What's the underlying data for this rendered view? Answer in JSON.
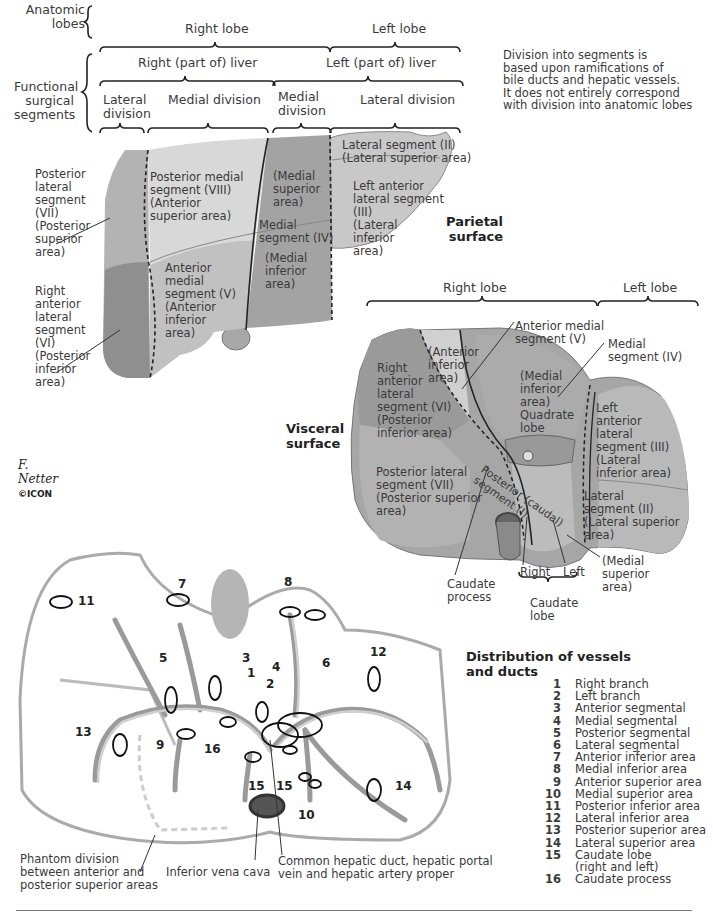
{
  "header": {
    "anatomic_lobes_label": "Anatomic\nlobes",
    "functional_label": "Functional\nsurgical\nsegments",
    "right_lobe": "Right lobe",
    "left_lobe": "Left lobe",
    "right_part": "Right (part of) liver",
    "left_part": "Left (part of) liver",
    "divisions": [
      "Lateral\ndivision",
      "Medial division",
      "Medial\ndivision",
      "Lateral division"
    ],
    "note": "Division into segments is\nbased upon ramifications of\nbile ducts and hepatic vessels.\nIt does not entirely correspond\nwith division into anatomic lobes"
  },
  "parietal": {
    "title": "Parietal\nsurface",
    "labels": {
      "seg_vii": "Posterior\nlateral\nsegment\n(VII)\n(Posterior\nsuperior\narea)",
      "seg_vi": "Right\nanterior\nlateral\nsegment\n(VI)\n(Posterior\ninferior\narea)",
      "seg_viii": "Posterior medial\nsegment (VIII)\n(Anterior\nsuperior area)",
      "seg_v": "Anterior\nmedial\nsegment (V)\n(Anterior\ninferior\narea)",
      "medial_superior": "(Medial\nsuperior\narea)",
      "seg_iv": "Medial\nsegment (IV)",
      "medial_inferior": "(Medial\ninferior\narea)",
      "seg_ii": "Lateral segment (II)\n(Lateral superior area)",
      "seg_iii": "Left anterior\nlateral segment\n(III)\n(Lateral\ninferior\narea)"
    }
  },
  "visceral": {
    "title": "Visceral\nsurface",
    "right_lobe": "Right lobe",
    "left_lobe": "Left lobe",
    "labels": {
      "ant_medial_v": "Anterior medial\nsegment (V)",
      "medial_iv": "Medial\nsegment (IV)",
      "anterior_inferior": "(Anterior\ninferior\narea)",
      "seg_vi": "Right\nanterior\nlateral\nsegment (VI)\n(Posterior\ninferior area)",
      "quadrate": "(Medial\ninferior\narea)\nQuadrate\nlobe",
      "seg_iii": "Left\nanterior\nlateral\nsegment (III)\n(Lateral\ninferior area)",
      "seg_vii": "Posterior lateral\nsegment (VII)\n(Posterior superior\n   area)",
      "caudal": "Posterior (caudal)\nsegment (I)",
      "seg_ii": "Lateral\nsegment (II)\n(Lateral superior\n      area)",
      "medial_superior": "(Medial\nsuperior\narea)",
      "caudate_process": "Caudate\nprocess",
      "right": "Right",
      "left": "Left",
      "caudate_lobe": "Caudate\nlobe"
    }
  },
  "vessels": {
    "title": "Distribution of vessels\nand ducts",
    "numbers": [
      "1",
      "2",
      "3",
      "4",
      "5",
      "6",
      "7",
      "8",
      "9",
      "10",
      "11",
      "12",
      "13",
      "14",
      "15",
      "15",
      "16"
    ],
    "phantom": "Phantom division\nbetween anterior and\nposterior superior areas",
    "ivc": "Inferior vena cava",
    "common": "Common hepatic duct, hepatic portal\nvein and hepatic artery proper",
    "legend": [
      {
        "n": "1",
        "t": "Right branch"
      },
      {
        "n": "2",
        "t": "Left branch"
      },
      {
        "n": "3",
        "t": "Anterior segmental"
      },
      {
        "n": "4",
        "t": "Medial segmental"
      },
      {
        "n": "5",
        "t": "Posterior segmental"
      },
      {
        "n": "6",
        "t": "Lateral segmental"
      },
      {
        "n": "7",
        "t": "Anterior inferior area"
      },
      {
        "n": "8",
        "t": "Medial inferior area"
      },
      {
        "n": "9",
        "t": "Anterior superior area"
      },
      {
        "n": "10",
        "t": "Medial superior area"
      },
      {
        "n": "11",
        "t": "Posterior inferior area"
      },
      {
        "n": "12",
        "t": "Lateral inferior area"
      },
      {
        "n": "13",
        "t": "Posterior superior area"
      },
      {
        "n": "14",
        "t": "Lateral superior area"
      },
      {
        "n": "15",
        "t": "Caudate lobe\n(right and left)"
      },
      {
        "n": "16",
        "t": "Caudate process"
      }
    ]
  },
  "logo": {
    "signature": "F. Netter",
    "brand": "©ICON"
  },
  "colors": {
    "seg_light": "#d4d4d4",
    "seg_mid": "#bdbdbd",
    "seg_dark": "#9c9c9c",
    "seg_darker": "#8a8a8a",
    "outline": "#6e6e6e"
  }
}
